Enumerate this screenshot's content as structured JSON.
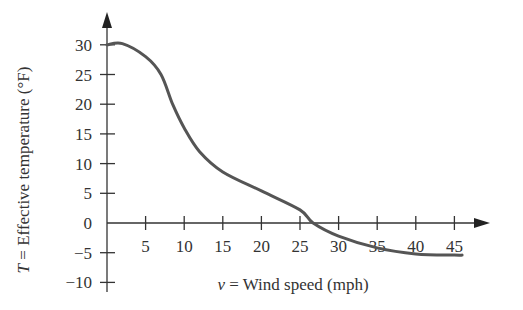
{
  "chart_data": {
    "type": "line",
    "title": "",
    "xlabel": "v = Wind speed (mph)",
    "xlabel_var": "v",
    "xlabel_text": " = Wind speed (mph)",
    "ylabel": "T = Effective temperature (°F)",
    "ylabel_var": "T",
    "ylabel_text": " = Effective temperature (°F)",
    "x_ticks": [
      5,
      10,
      15,
      20,
      25,
      30,
      35,
      40,
      45
    ],
    "y_ticks": [
      -10,
      -5,
      0,
      5,
      10,
      15,
      20,
      25,
      30
    ],
    "xlim": [
      0,
      48
    ],
    "ylim": [
      -12,
      33
    ],
    "grid": false,
    "legend": null,
    "series": [
      {
        "name": "Effective temperature",
        "color": "#555555",
        "x": [
          0,
          2,
          5,
          7,
          8.5,
          10,
          12,
          15,
          20,
          25,
          26.7,
          30,
          35,
          40,
          45,
          46
        ],
        "y": [
          30,
          30.2,
          28,
          25,
          20,
          16,
          12,
          8.6,
          5.4,
          2.2,
          0,
          -2.2,
          -4.2,
          -5.2,
          -5.4,
          -5.4
        ]
      }
    ]
  },
  "tick_labels": {
    "x": [
      "5",
      "10",
      "15",
      "20",
      "25",
      "30",
      "35",
      "40",
      "45"
    ],
    "y": [
      "30",
      "25",
      "20",
      "15",
      "10",
      "5",
      "0",
      "−5",
      "−10"
    ]
  }
}
